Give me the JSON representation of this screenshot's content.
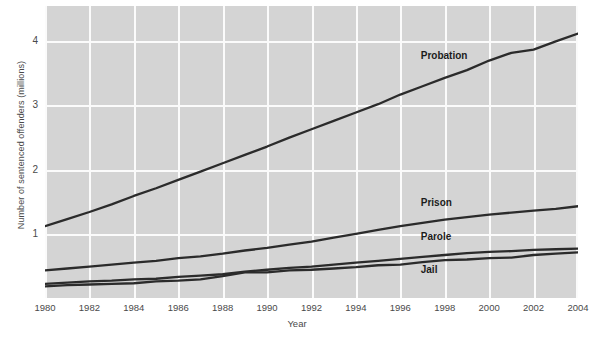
{
  "chart_data": {
    "type": "line",
    "title": "",
    "xlabel": "Year",
    "ylabel": "Number of sentenced offenders (millions)",
    "xlim": [
      1980,
      2004
    ],
    "ylim": [
      0,
      4.55
    ],
    "xticks": [
      1980,
      1982,
      1984,
      1986,
      1988,
      1990,
      1992,
      1994,
      1996,
      1998,
      2000,
      2002,
      2004
    ],
    "yticks": [
      1,
      2,
      3,
      4
    ],
    "grid": true,
    "legend_position": "inline-annotations",
    "x": [
      1980,
      1981,
      1982,
      1983,
      1984,
      1985,
      1986,
      1987,
      1988,
      1989,
      1990,
      1991,
      1992,
      1993,
      1994,
      1995,
      1996,
      1997,
      1998,
      1999,
      2000,
      2001,
      2002,
      2003,
      2004
    ],
    "series": [
      {
        "name": "Probation",
        "values": [
          1.12,
          1.23,
          1.34,
          1.46,
          1.59,
          1.71,
          1.84,
          1.97,
          2.1,
          2.23,
          2.36,
          2.5,
          2.63,
          2.76,
          2.89,
          3.02,
          3.17,
          3.3,
          3.43,
          3.55,
          3.7,
          3.82,
          3.87,
          4.0,
          4.12
        ]
      },
      {
        "name": "Prison",
        "values": [
          0.43,
          0.46,
          0.49,
          0.52,
          0.55,
          0.58,
          0.62,
          0.65,
          0.69,
          0.74,
          0.78,
          0.83,
          0.88,
          0.94,
          1.0,
          1.06,
          1.12,
          1.17,
          1.22,
          1.26,
          1.3,
          1.33,
          1.36,
          1.39,
          1.43
        ]
      },
      {
        "name": "Parole",
        "values": [
          0.22,
          0.24,
          0.26,
          0.27,
          0.29,
          0.3,
          0.33,
          0.35,
          0.37,
          0.41,
          0.44,
          0.47,
          0.49,
          0.52,
          0.55,
          0.58,
          0.61,
          0.64,
          0.67,
          0.7,
          0.72,
          0.73,
          0.75,
          0.76,
          0.77
        ]
      },
      {
        "name": "Jail",
        "values": [
          0.18,
          0.2,
          0.21,
          0.22,
          0.23,
          0.26,
          0.27,
          0.29,
          0.34,
          0.4,
          0.4,
          0.43,
          0.44,
          0.46,
          0.48,
          0.51,
          0.52,
          0.56,
          0.59,
          0.6,
          0.62,
          0.63,
          0.67,
          0.69,
          0.71
        ]
      }
    ],
    "line_color": "#2b2b2b",
    "plot_background": "#d4d4d4",
    "grid_color": "#fbfbfb",
    "annotations": [
      {
        "text": "Probation",
        "x": 1998,
        "y": 3.75
      },
      {
        "text": "Prison",
        "x": 1998,
        "y": 1.47
      },
      {
        "text": "Parole",
        "x": 1998,
        "y": 0.93
      },
      {
        "text": "Jail",
        "x": 1998,
        "y": 0.42
      }
    ]
  },
  "axis": {
    "y_title": "Number of sentenced offenders (millions)",
    "x_title": "Year",
    "y_tick_labels": [
      "4",
      "3",
      "2",
      "1"
    ],
    "x_tick_labels": [
      "1980",
      "1982",
      "1984",
      "1986",
      "1988",
      "1990",
      "1992",
      "1994",
      "1996",
      "1998",
      "2000",
      "2002",
      "2004"
    ]
  },
  "labels": {
    "probation": "Probation",
    "prison": "Prison",
    "parole": "Parole",
    "jail": "Jail"
  }
}
